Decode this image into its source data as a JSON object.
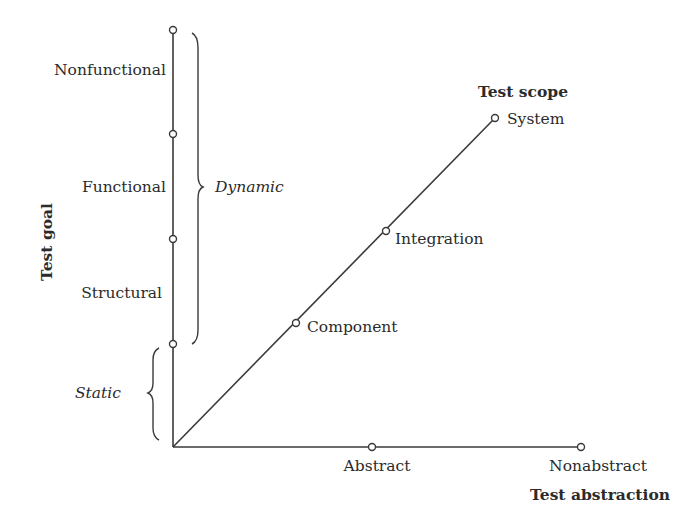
{
  "diagram": {
    "type": "three-axis test classification diagram",
    "axes": {
      "goal": {
        "title": "Test goal",
        "levels": [
          "Nonfunctional",
          "Functional",
          "Structural"
        ],
        "groups": [
          {
            "label": "Dynamic",
            "covers": [
              "Nonfunctional",
              "Functional",
              "Structural"
            ]
          },
          {
            "label": "Static",
            "covers": []
          }
        ]
      },
      "scope": {
        "title": "Test scope",
        "levels": [
          "Component",
          "Integration",
          "System"
        ]
      },
      "abstraction": {
        "title": "Test abstraction",
        "levels": [
          "Abstract",
          "Nonabstract"
        ]
      }
    }
  },
  "labels": {
    "nonfunctional": "Nonfunctional",
    "functional": "Functional",
    "structural": "Structural",
    "dynamic": "Dynamic",
    "static": "Static",
    "test_goal": "Test goal",
    "test_scope": "Test scope",
    "system": "System",
    "integration": "Integration",
    "component": "Component",
    "abstract": "Abstract",
    "nonabstract": "Nonabstract",
    "test_abstraction": "Test abstraction"
  },
  "colors": {
    "line": "#3a3a3a",
    "text": "#2b2b2b",
    "background": "#ffffff"
  }
}
